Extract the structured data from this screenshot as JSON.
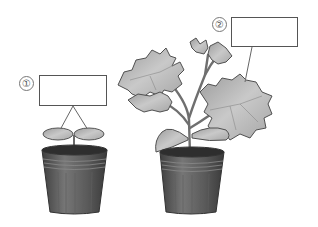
{
  "figure": {
    "labels": [
      {
        "id": "1",
        "text": "①",
        "answer": ""
      },
      {
        "id": "2",
        "text": "②",
        "answer": ""
      }
    ],
    "plants": [
      {
        "name": "seedling",
        "parts": [
          "cotyledons",
          "stem",
          "pot"
        ]
      },
      {
        "name": "grown-plant",
        "parts": [
          "true-leaves",
          "cotyledons",
          "stem",
          "pot"
        ]
      }
    ],
    "colors": {
      "background": "#ffffff",
      "box_border": "#555555",
      "pot_dark": "#4a4a4a",
      "pot_mid": "#6e6e6e",
      "soil": "#2e2e2e",
      "leaf_fill": "#b8b8b8",
      "leaf_edge": "#555555",
      "stem": "#7a7a7a",
      "leader_line": "#666666"
    }
  }
}
